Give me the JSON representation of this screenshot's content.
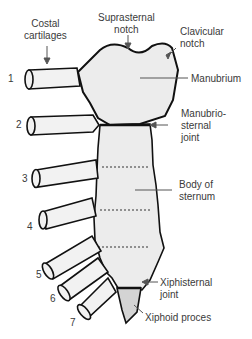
{
  "figure": {
    "labels": {
      "costal_cartilages": [
        "Costal",
        "cartilages"
      ],
      "suprasternal_notch": [
        "Suprasternal",
        "notch"
      ],
      "clavicular_notch": [
        "Clavicular",
        "notch"
      ],
      "manubrium": "Manubrium",
      "manubriosternal_joint": [
        "Manubrio-",
        "sternal",
        "joint"
      ],
      "body_of_sternum": [
        "Body of",
        "sternum"
      ],
      "xiphisternal_joint": [
        "Xiphisternal",
        "joint"
      ],
      "xiphoid_process": "Xiphoid proces"
    },
    "rib_numbers": [
      "1",
      "2",
      "3",
      "4",
      "5",
      "6",
      "7"
    ],
    "colors": {
      "bone_fill": "#ececec",
      "xiphoid_fill": "#d4d4d4",
      "outline": "#111111",
      "text": "#3a3a3a"
    }
  }
}
